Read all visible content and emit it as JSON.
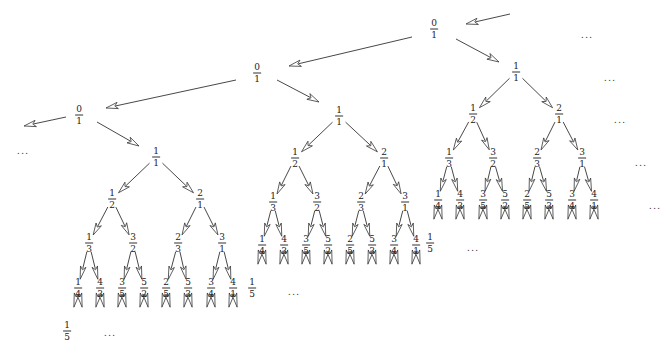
{
  "figure": {
    "colors": {
      "line": "#333333",
      "arrowhead_fill": "#ffffff",
      "text": "#222222"
    },
    "chain_nodes": [
      {
        "id": "zero-top",
        "num": "0",
        "den": "1",
        "x": 434,
        "y": 29
      },
      {
        "id": "zero-middle",
        "num": "0",
        "den": "1",
        "x": 257,
        "y": 73
      },
      {
        "id": "zero-left",
        "num": "0",
        "den": "1",
        "x": 79,
        "y": 115
      }
    ],
    "chain_edges": [
      {
        "from": [
          510,
          14
        ],
        "to": [
          466,
          24
        ]
      },
      {
        "from": [
          412,
          37
        ],
        "to": [
          289,
          66
        ]
      },
      {
        "from": [
          236,
          80
        ],
        "to": [
          106,
          108
        ]
      },
      {
        "from": [
          66,
          117
        ],
        "to": [
          24,
          126
        ]
      },
      {
        "from": [
          456,
          39
        ],
        "to": [
          499,
          62
        ]
      },
      {
        "from": [
          277,
          80
        ],
        "to": [
          319,
          102
        ]
      },
      {
        "from": [
          97,
          122
        ],
        "to": [
          139,
          146
        ]
      }
    ],
    "trees": [
      {
        "name": "right-tree",
        "root": {
          "num": "1",
          "den": "1",
          "x": 516,
          "y": 72
        },
        "level2": [
          {
            "num": "1",
            "den": "2",
            "x": 473,
            "y": 114
          },
          {
            "num": "2",
            "den": "1",
            "x": 559,
            "y": 114
          }
        ],
        "level3": [
          {
            "num": "1",
            "den": "3",
            "x": 449,
            "y": 158
          },
          {
            "num": "3",
            "den": "2",
            "x": 493,
            "y": 158
          },
          {
            "num": "2",
            "den": "3",
            "x": 537,
            "y": 158
          },
          {
            "num": "3",
            "den": "1",
            "x": 582,
            "y": 158
          }
        ],
        "level4": [
          {
            "num": "1",
            "den": "4",
            "x": 438,
            "y": 200
          },
          {
            "num": "4",
            "den": "3",
            "x": 460,
            "y": 200
          },
          {
            "num": "3",
            "den": "5",
            "x": 483,
            "y": 200
          },
          {
            "num": "5",
            "den": "2",
            "x": 505,
            "y": 200
          },
          {
            "num": "2",
            "den": "5",
            "x": 527,
            "y": 200
          },
          {
            "num": "5",
            "den": "3",
            "x": 549,
            "y": 200
          },
          {
            "num": "3",
            "den": "4",
            "x": 572,
            "y": 200
          },
          {
            "num": "4",
            "den": "1",
            "x": 594,
            "y": 200
          }
        ],
        "level5_first": {
          "num": "1",
          "den": "5",
          "x": 430,
          "y": 243
        },
        "ellipsis": {
          "text": "...",
          "x": 473,
          "y": 247
        }
      },
      {
        "name": "middle-tree",
        "root": {
          "num": "1",
          "den": "1",
          "x": 339,
          "y": 116
        },
        "level2": [
          {
            "num": "1",
            "den": "2",
            "x": 295,
            "y": 158
          },
          {
            "num": "2",
            "den": "1",
            "x": 384,
            "y": 158
          }
        ],
        "level3": [
          {
            "num": "1",
            "den": "3",
            "x": 273,
            "y": 202
          },
          {
            "num": "3",
            "den": "2",
            "x": 317,
            "y": 202
          },
          {
            "num": "2",
            "den": "3",
            "x": 361,
            "y": 202
          },
          {
            "num": "3",
            "den": "1",
            "x": 405,
            "y": 202
          }
        ],
        "level4": [
          {
            "num": "1",
            "den": "4",
            "x": 262,
            "y": 245
          },
          {
            "num": "4",
            "den": "3",
            "x": 284,
            "y": 245
          },
          {
            "num": "3",
            "den": "5",
            "x": 306,
            "y": 245
          },
          {
            "num": "5",
            "den": "2",
            "x": 328,
            "y": 245
          },
          {
            "num": "2",
            "den": "5",
            "x": 350,
            "y": 245
          },
          {
            "num": "5",
            "den": "3",
            "x": 372,
            "y": 245
          },
          {
            "num": "3",
            "den": "4",
            "x": 394,
            "y": 245
          },
          {
            "num": "4",
            "den": "1",
            "x": 416,
            "y": 245
          }
        ],
        "level5_first": {
          "num": "1",
          "den": "5",
          "x": 252,
          "y": 288
        },
        "ellipsis": {
          "text": "...",
          "x": 294,
          "y": 291
        }
      },
      {
        "name": "left-tree",
        "root": {
          "num": "1",
          "den": "1",
          "x": 156,
          "y": 157
        },
        "level2": [
          {
            "num": "1",
            "den": "2",
            "x": 112,
            "y": 199
          },
          {
            "num": "2",
            "den": "1",
            "x": 200,
            "y": 199
          }
        ],
        "level3": [
          {
            "num": "1",
            "den": "3",
            "x": 89,
            "y": 243
          },
          {
            "num": "3",
            "den": "2",
            "x": 133,
            "y": 243
          },
          {
            "num": "2",
            "den": "3",
            "x": 178,
            "y": 243
          },
          {
            "num": "3",
            "den": "1",
            "x": 222,
            "y": 243
          }
        ],
        "level4": [
          {
            "num": "1",
            "den": "4",
            "x": 78,
            "y": 288
          },
          {
            "num": "4",
            "den": "3",
            "x": 100,
            "y": 288
          },
          {
            "num": "3",
            "den": "5",
            "x": 122,
            "y": 288
          },
          {
            "num": "5",
            "den": "2",
            "x": 144,
            "y": 288
          },
          {
            "num": "2",
            "den": "5",
            "x": 166,
            "y": 288
          },
          {
            "num": "5",
            "den": "3",
            "x": 188,
            "y": 288
          },
          {
            "num": "3",
            "den": "4",
            "x": 211,
            "y": 288
          },
          {
            "num": "4",
            "den": "1",
            "x": 233,
            "y": 288
          }
        ],
        "level5_first": {
          "num": "1",
          "den": "5",
          "x": 67,
          "y": 331
        },
        "ellipsis": {
          "text": "...",
          "x": 110,
          "y": 332
        }
      }
    ],
    "side_ellipses": [
      {
        "text": "...",
        "x": 587,
        "y": 34
      },
      {
        "text": "...",
        "x": 610,
        "y": 77
      },
      {
        "text": "...",
        "x": 620,
        "y": 119
      },
      {
        "text": "...",
        "x": 641,
        "y": 162
      },
      {
        "text": "...",
        "x": 655,
        "y": 205
      },
      {
        "text": "...",
        "x": 23,
        "y": 150
      }
    ]
  }
}
